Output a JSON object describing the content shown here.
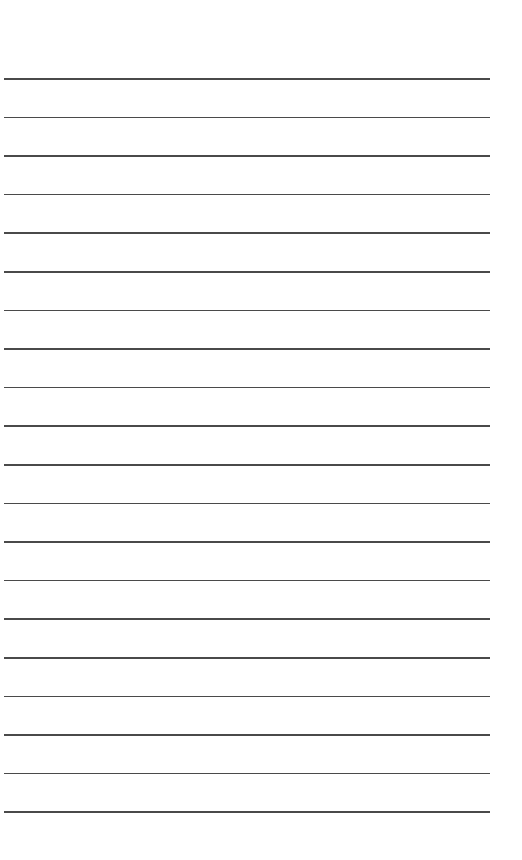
{
  "page": {
    "type": "lined-paper",
    "background_color": "#ffffff",
    "line_color": "#4a4a4a",
    "line_count": 20,
    "first_line_y": 78,
    "line_spacing": 38.6,
    "line_left": 4,
    "line_width": 486,
    "lines": [
      "",
      "",
      "",
      "",
      "",
      "",
      "",
      "",
      "",
      "",
      "",
      "",
      "",
      "",
      "",
      "",
      "",
      "",
      "",
      ""
    ]
  }
}
